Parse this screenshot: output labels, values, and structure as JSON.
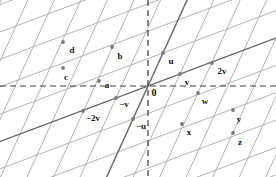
{
  "figure": {
    "width": 276,
    "height": 177,
    "background_color": "#ffffff",
    "origin": {
      "x": 148,
      "y": 86
    },
    "basis": {
      "u": {
        "dx": 15,
        "dy": -33,
        "label": "u"
      },
      "v": {
        "dx": 32,
        "dy": -12,
        "label": "v"
      }
    },
    "colors": {
      "grid_light": "#a9a9a9",
      "grid_dark": "#6e6e6e",
      "axis_dashed": "#3a3a3a",
      "point": "#7b7b7b",
      "label": "#111111"
    },
    "axes": [
      {
        "name": "horizontal-dashed-axis",
        "orientation": "horizontal",
        "y": 86,
        "style": "dashed"
      },
      {
        "name": "vertical-dashed-axis",
        "orientation": "vertical",
        "x": 148,
        "style": "dashed"
      }
    ],
    "highlighted_lines": [
      {
        "name": "v-direction-line",
        "through": "origin",
        "direction": "v"
      },
      {
        "name": "u-direction-line",
        "through": "origin",
        "direction": "u"
      }
    ]
  },
  "points": [
    {
      "name": "point-d",
      "label": "d",
      "x": 63,
      "y": 42,
      "lx": 72,
      "ly": 50
    },
    {
      "name": "point-b",
      "label": "b",
      "x": 112,
      "y": 47,
      "lx": 120,
      "ly": 56
    },
    {
      "name": "point-u",
      "label": "u",
      "x": 163,
      "y": 53,
      "lx": 171,
      "ly": 61
    },
    {
      "name": "point-c",
      "label": "c",
      "x": 63,
      "y": 68,
      "lx": 66,
      "ly": 77
    },
    {
      "name": "point-2v",
      "label": "2v",
      "x": 212,
      "y": 63,
      "lx": 222,
      "ly": 71
    },
    {
      "name": "point-a",
      "label": "a",
      "x": 99,
      "y": 81,
      "lx": 107,
      "ly": 85
    },
    {
      "name": "point-v",
      "label": "v",
      "x": 180,
      "y": 74,
      "lx": 187,
      "ly": 82
    },
    {
      "name": "point-origin",
      "label": "0",
      "x": 148,
      "y": 86,
      "lx": 154,
      "ly": 93
    },
    {
      "name": "point-neg-v",
      "label": "−v",
      "x": 116,
      "y": 98,
      "lx": 124,
      "ly": 104
    },
    {
      "name": "point-w",
      "label": "w",
      "x": 198,
      "y": 93,
      "lx": 205,
      "ly": 101
    },
    {
      "name": "point-neg-2v",
      "label": "−2v",
      "x": 83,
      "y": 111,
      "lx": 93,
      "ly": 118
    },
    {
      "name": "point-neg-u",
      "label": "−u",
      "x": 133,
      "y": 119,
      "lx": 141,
      "ly": 126
    },
    {
      "name": "point-y",
      "label": "y",
      "x": 233,
      "y": 110,
      "lx": 239,
      "ly": 119
    },
    {
      "name": "point-x",
      "label": "x",
      "x": 182,
      "y": 124,
      "lx": 189,
      "ly": 132
    },
    {
      "name": "point-z",
      "label": "z",
      "x": 233,
      "y": 133,
      "lx": 240,
      "ly": 142
    }
  ]
}
